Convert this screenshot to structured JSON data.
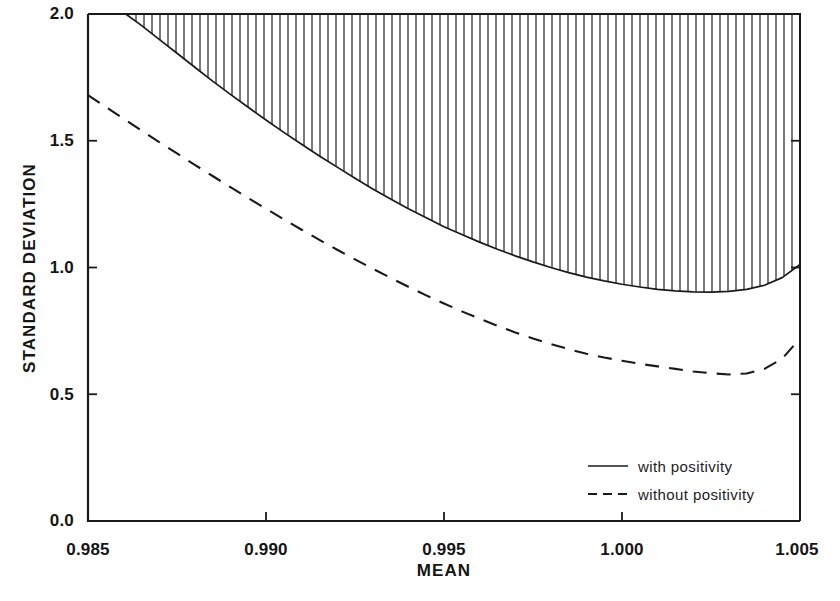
{
  "chart_data": {
    "type": "line",
    "title": "",
    "xlabel": "MEAN",
    "ylabel": "STANDARD DEVIATION",
    "xlim": [
      0.985,
      1.005
    ],
    "ylim": [
      0.0,
      2.0
    ],
    "xticks": [
      "0.985",
      "0.990",
      "0.995",
      "1.000",
      "1.005"
    ],
    "xtick_values": [
      0.985,
      0.99,
      0.995,
      1.0,
      1.005
    ],
    "yticks": [
      "0.0",
      "0.5",
      "1.0",
      "1.5",
      "2.0"
    ],
    "ytick_values": [
      0.0,
      0.5,
      1.0,
      1.5,
      2.0
    ],
    "grid": false,
    "legend_position": "lower right",
    "shaded_region": {
      "description": "vertical hatch fill between the with-positivity curve and the top of the axes",
      "hatch": "vertical-lines",
      "color": "#1a1a1a"
    },
    "series": [
      {
        "name": "with positivity",
        "style": "solid",
        "color": "#1a1a1a",
        "x": [
          0.98606,
          0.9865,
          0.987,
          0.9875,
          0.988,
          0.9885,
          0.989,
          0.9895,
          0.99,
          0.9905,
          0.991,
          0.9915,
          0.992,
          0.9925,
          0.993,
          0.9935,
          0.994,
          0.9945,
          0.995,
          0.9955,
          0.996,
          0.9965,
          0.997,
          0.9975,
          0.998,
          0.9985,
          0.999,
          0.9995,
          1.0,
          1.0005,
          1.001,
          1.0015,
          1.002,
          1.0025,
          1.003,
          1.0035,
          1.004,
          1.0045,
          1.005
        ],
        "y": [
          2.0,
          1.955,
          1.9,
          1.845,
          1.79,
          1.735,
          1.683,
          1.632,
          1.582,
          1.533,
          1.486,
          1.44,
          1.396,
          1.352,
          1.31,
          1.27,
          1.232,
          1.196,
          1.161,
          1.13,
          1.1,
          1.072,
          1.046,
          1.022,
          1.0,
          0.98,
          0.962,
          0.947,
          0.934,
          0.923,
          0.914,
          0.908,
          0.904,
          0.903,
          0.906,
          0.914,
          0.93,
          0.96,
          1.012
        ]
      },
      {
        "name": "without positivity",
        "style": "dashed",
        "color": "#1a1a1a",
        "x": [
          0.985,
          0.9855,
          0.986,
          0.9865,
          0.987,
          0.9875,
          0.988,
          0.9885,
          0.989,
          0.9895,
          0.99,
          0.9905,
          0.991,
          0.9915,
          0.992,
          0.9925,
          0.993,
          0.9935,
          0.994,
          0.9945,
          0.995,
          0.9955,
          0.996,
          0.9965,
          0.997,
          0.9975,
          0.998,
          0.9985,
          0.999,
          0.9995,
          1.0,
          1.0005,
          1.001,
          1.0015,
          1.002,
          1.0025,
          1.003,
          1.0035,
          1.004,
          1.0045,
          1.005
        ],
        "y": [
          1.68,
          1.633,
          1.587,
          1.541,
          1.495,
          1.45,
          1.405,
          1.361,
          1.317,
          1.274,
          1.232,
          1.19,
          1.149,
          1.109,
          1.07,
          1.032,
          0.995,
          0.959,
          0.924,
          0.89,
          0.858,
          0.827,
          0.798,
          0.77,
          0.744,
          0.72,
          0.698,
          0.678,
          0.66,
          0.645,
          0.632,
          0.62,
          0.61,
          0.6,
          0.59,
          0.583,
          0.578,
          0.582,
          0.6,
          0.64,
          0.72
        ]
      }
    ],
    "minima": [
      {
        "series": "with positivity",
        "x": 1.0025,
        "y": 0.9
      },
      {
        "series": "without positivity",
        "x": 1.0029,
        "y": 0.578
      }
    ],
    "legend": [
      {
        "label": "with positivity",
        "style": "solid"
      },
      {
        "label": "without positivity",
        "style": "dashed"
      }
    ]
  }
}
